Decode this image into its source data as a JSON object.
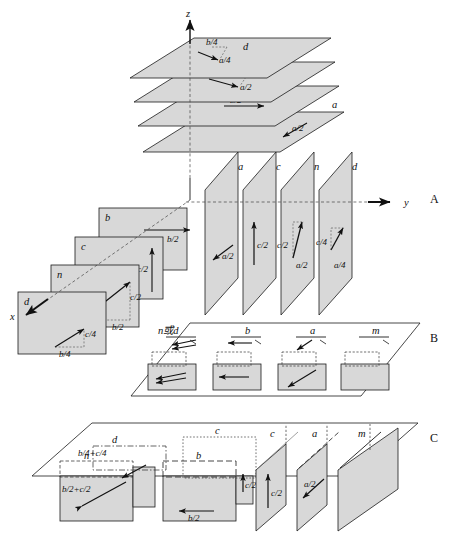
{
  "figure": {
    "fill_color": "#d8d8d8",
    "stroke_color": "#1a1a1a",
    "background": "#ffffff"
  },
  "axes": {
    "z": "z",
    "y": "y",
    "x": "x"
  },
  "panels": [
    {
      "id": "A",
      "label": "A"
    },
    {
      "id": "B",
      "label": "B"
    },
    {
      "id": "C",
      "label": "C"
    }
  ],
  "panel_a": {
    "horizontal_stack": {
      "description": "Planes perpendicular to z, stacked vertically",
      "planes": [
        {
          "name": "d",
          "label": "d",
          "vector_parts": [
            "b/4",
            "a/4"
          ]
        },
        {
          "name": "n",
          "label": "n",
          "vector_parts": [
            "b/2",
            "a/2"
          ]
        },
        {
          "name": "b",
          "label": "b",
          "vector_parts": [
            "b/2"
          ]
        },
        {
          "name": "a",
          "label": "a",
          "vector_parts": [
            "a/2"
          ]
        }
      ]
    },
    "left_stack": {
      "description": "Planes perpendicular to x",
      "planes": [
        {
          "name": "b",
          "label": "b",
          "vector_parts": [
            "b/2"
          ]
        },
        {
          "name": "c",
          "label": "c",
          "vector_parts": [
            "c/2"
          ]
        },
        {
          "name": "n",
          "label": "n",
          "vector_parts": [
            "b/2",
            "c/2"
          ]
        },
        {
          "name": "d",
          "label": "d",
          "vector_parts": [
            "b/4",
            "c/4"
          ]
        }
      ]
    },
    "right_stack": {
      "description": "Planes perpendicular to y",
      "planes": [
        {
          "name": "a",
          "label": "a",
          "vector_parts": [
            "a/2"
          ]
        },
        {
          "name": "c",
          "label": "c",
          "vector_parts": [
            "c/2"
          ]
        },
        {
          "name": "n",
          "label": "n",
          "vector_parts": [
            "c/2",
            "a/2"
          ]
        },
        {
          "name": "d",
          "label": "d",
          "vector_parts": [
            "c/4",
            "a/4"
          ]
        }
      ]
    }
  },
  "panel_b": {
    "description": "Plan projection of glide planes parallel to the drawing plane",
    "planes": [
      {
        "name": "n-or-d",
        "label": "n或d"
      },
      {
        "name": "b",
        "label": "b"
      },
      {
        "name": "a",
        "label": "a"
      },
      {
        "name": "m",
        "label": "m"
      }
    ]
  },
  "panel_c": {
    "description": "Perspective view of vertical symmetry planes",
    "planes": [
      {
        "name": "n",
        "label": "n",
        "vector": "b/2+c/2"
      },
      {
        "name": "d",
        "label": "d",
        "vector": "b/4+c/4"
      },
      {
        "name": "b",
        "label": "b",
        "vector": "b/2"
      },
      {
        "name": "c-front",
        "label": "c",
        "vector": "c/2"
      },
      {
        "name": "c-back",
        "label": "c",
        "vector": "c/2"
      },
      {
        "name": "a",
        "label": "a",
        "vector": "a/2"
      },
      {
        "name": "m",
        "label": "m",
        "vector": ""
      }
    ]
  },
  "vector_labels": {
    "b_quarter": "b/4",
    "a_quarter": "a/4",
    "b_half": "b/2",
    "a_half": "a/2",
    "c_half": "c/2",
    "c_quarter": "c/4",
    "b_half_plus_c_half": "b/2+c/2",
    "b_quarter_plus_c_quarter": "b/4+c/4"
  }
}
